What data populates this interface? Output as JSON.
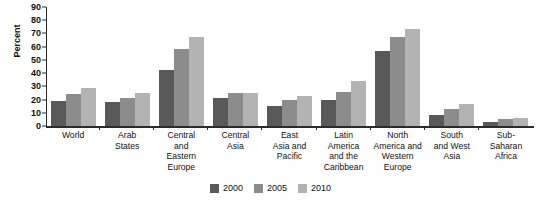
{
  "chart_data": {
    "type": "bar",
    "title": "",
    "xlabel": "",
    "ylabel": "Percent",
    "ylim": [
      0,
      90
    ],
    "yticks": [
      0,
      10,
      20,
      30,
      40,
      50,
      60,
      70,
      80,
      90
    ],
    "grid": false,
    "legend_position": "bottom-center",
    "categories": [
      "World",
      "Arab States",
      "Central and Eastern Europe",
      "Central Asia",
      "East Asia and Pacific",
      "Latin America and the Caribbean",
      "North America and Western Europe",
      "South and West Asia",
      "Sub-Saharan Africa"
    ],
    "category_lines": [
      [
        "World"
      ],
      [
        "Arab",
        "States"
      ],
      [
        "Central",
        "and",
        "Eastern",
        "Europe"
      ],
      [
        "Central",
        "Asia"
      ],
      [
        "East",
        "Asia and",
        "Pacific"
      ],
      [
        "Latin",
        "America",
        "and the",
        "Caribbean"
      ],
      [
        "North",
        "America and",
        "Western",
        "Europe"
      ],
      [
        "South",
        "and West",
        "Asia"
      ],
      [
        "Sub-",
        "Saharan",
        "Africa"
      ]
    ],
    "series": [
      {
        "name": "2000",
        "color": "#595959",
        "values": [
          19,
          18.5,
          42,
          21,
          15,
          20,
          57,
          8,
          3
        ]
      },
      {
        "name": "2005",
        "color": "#8c8c8c",
        "values": [
          24,
          21.5,
          58,
          25,
          20,
          26,
          67,
          13,
          5
        ]
      },
      {
        "name": "2010",
        "color": "#b3b3b3",
        "values": [
          29,
          25,
          67,
          25,
          23,
          34,
          73,
          17,
          6
        ]
      }
    ]
  },
  "legend": {
    "items": [
      {
        "label": "2000",
        "color": "#595959"
      },
      {
        "label": "2005",
        "color": "#8c8c8c"
      },
      {
        "label": "2010",
        "color": "#b3b3b3"
      }
    ]
  },
  "axis": {
    "y_title": "Percent"
  }
}
